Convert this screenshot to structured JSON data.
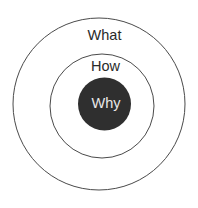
{
  "diagram": {
    "type": "golden-circle",
    "rings": [
      {
        "id": "outer",
        "label": "What",
        "fill": "#ffffff",
        "stroke": "#4a4a4a",
        "text_color": "#2a2a2a"
      },
      {
        "id": "middle",
        "label": "How",
        "fill": "#ffffff",
        "stroke": "#4a4a4a",
        "text_color": "#2a2a2a"
      },
      {
        "id": "core",
        "label": "Why",
        "fill": "#2f2f2f",
        "stroke": "#2f2f2f",
        "text_color": "#e8e8e8"
      }
    ]
  }
}
